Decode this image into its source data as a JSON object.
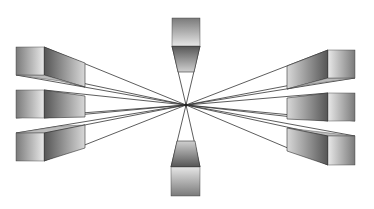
{
  "diagram": {
    "title": "",
    "type": "one-point perspective boxes converging to vanishing point",
    "vanishing_point": {
      "x": 186,
      "y": 105
    },
    "colors": {
      "background": "#ffffff",
      "line": "#333333",
      "face_light": "#e6e6e6",
      "face_dark": "#6a6a6a"
    },
    "boxes": [
      {
        "id": "top",
        "position": "top-center"
      },
      {
        "id": "bottom",
        "position": "bottom-center"
      },
      {
        "id": "left-1",
        "position": "left-top"
      },
      {
        "id": "left-2",
        "position": "left-middle"
      },
      {
        "id": "left-3",
        "position": "left-bottom"
      },
      {
        "id": "right-1",
        "position": "right-top"
      },
      {
        "id": "right-2",
        "position": "right-middle"
      },
      {
        "id": "right-3",
        "position": "right-bottom"
      }
    ]
  }
}
